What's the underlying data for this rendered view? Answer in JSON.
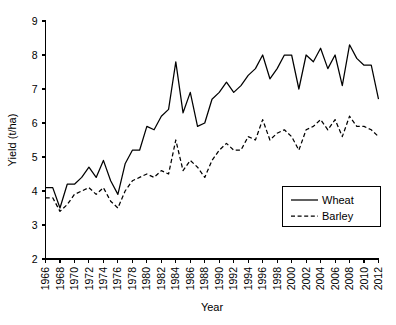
{
  "chart_data": {
    "type": "line",
    "title": "",
    "xlabel": "Year",
    "ylabel": "Yield (t/ha)",
    "xlim": [
      1966,
      2012
    ],
    "ylim": [
      2,
      9
    ],
    "yticks": [
      2,
      3,
      4,
      5,
      6,
      7,
      8,
      9
    ],
    "xticks": [
      1966,
      1968,
      1970,
      1972,
      1974,
      1976,
      1978,
      1980,
      1982,
      1984,
      1986,
      1988,
      1990,
      1992,
      1994,
      1996,
      1998,
      2000,
      2002,
      2004,
      2006,
      2008,
      2010,
      2012
    ],
    "grid": false,
    "legend_position": "bottom-right",
    "x": [
      1966,
      1967,
      1968,
      1969,
      1970,
      1971,
      1972,
      1973,
      1974,
      1975,
      1976,
      1977,
      1978,
      1979,
      1980,
      1981,
      1982,
      1983,
      1984,
      1985,
      1986,
      1987,
      1988,
      1989,
      1990,
      1991,
      1992,
      1993,
      1994,
      1995,
      1996,
      1997,
      1998,
      1999,
      2000,
      2001,
      2002,
      2003,
      2004,
      2005,
      2006,
      2007,
      2008,
      2009,
      2010,
      2011,
      2012
    ],
    "series": [
      {
        "name": "Wheat",
        "style": "solid",
        "color": "#000000",
        "values": [
          4.1,
          4.1,
          3.5,
          4.2,
          4.2,
          4.4,
          4.7,
          4.4,
          4.9,
          4.3,
          3.9,
          4.8,
          5.2,
          5.2,
          5.9,
          5.8,
          6.2,
          6.4,
          7.8,
          6.3,
          6.9,
          5.9,
          6.0,
          6.7,
          6.9,
          7.2,
          6.9,
          7.1,
          7.4,
          7.6,
          8.0,
          7.3,
          7.6,
          8.0,
          8.0,
          7.0,
          8.0,
          7.8,
          8.2,
          7.6,
          8.0,
          7.1,
          8.3,
          7.9,
          7.7,
          7.7,
          6.7
        ]
      },
      {
        "name": "Barley",
        "style": "dashed",
        "color": "#000000",
        "values": [
          3.8,
          3.8,
          3.4,
          3.6,
          3.9,
          4.0,
          4.1,
          3.9,
          4.1,
          3.7,
          3.5,
          4.0,
          4.3,
          4.4,
          4.5,
          4.4,
          4.6,
          4.5,
          5.5,
          4.6,
          4.9,
          4.7,
          4.4,
          4.9,
          5.2,
          5.4,
          5.2,
          5.2,
          5.6,
          5.5,
          6.1,
          5.5,
          5.7,
          5.8,
          5.6,
          5.2,
          5.8,
          5.9,
          6.1,
          5.8,
          6.1,
          5.6,
          6.2,
          5.9,
          5.9,
          5.8,
          5.6
        ]
      }
    ],
    "legend": [
      {
        "label": "Wheat",
        "style": "solid"
      },
      {
        "label": "Barley",
        "style": "dashed"
      }
    ]
  }
}
